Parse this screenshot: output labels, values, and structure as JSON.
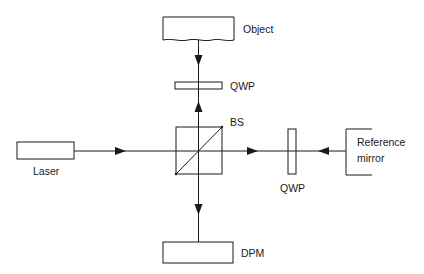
{
  "diagram": {
    "title": "",
    "components": {
      "object": {
        "label": "Object"
      },
      "qwp_top": {
        "label": "QWP"
      },
      "beam_splitter": {
        "label": "BS"
      },
      "laser": {
        "label": "Laser"
      },
      "qwp_right": {
        "label": "QWP"
      },
      "reference_mirror": {
        "label_line1": "Reference",
        "label_line2": "mirror"
      },
      "dpm": {
        "label": "DPM"
      }
    },
    "colors": {
      "stroke": "#1a1a1a",
      "background": "#ffffff"
    },
    "beam_paths": [
      {
        "from": "laser",
        "to": "beam_splitter",
        "direction": "right"
      },
      {
        "from": "beam_splitter",
        "to": "qwp_top",
        "direction": "up"
      },
      {
        "from": "object",
        "to": "qwp_top",
        "direction": "down"
      },
      {
        "from": "beam_splitter",
        "to": "qwp_right",
        "direction": "right"
      },
      {
        "from": "reference_mirror",
        "to": "qwp_right",
        "direction": "left"
      },
      {
        "from": "beam_splitter",
        "to": "dpm",
        "direction": "down"
      }
    ]
  }
}
